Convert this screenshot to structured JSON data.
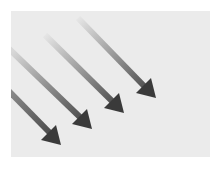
{
  "image": {
    "description": "Four parallel diagonal arrows pointing down-right, fading from light at the tail to dark gray at the head",
    "background_color": "#ebebeb",
    "page_color": "#ffffff",
    "arrow_color_head": "#3a3a3a",
    "arrow_color_tail": "#e0e0e0",
    "arrows": [
      {
        "x1": 78,
        "y1": 18,
        "x2": 156,
        "y2": 98
      },
      {
        "x1": 45,
        "y1": 35,
        "x2": 124,
        "y2": 113
      },
      {
        "x1": 12,
        "y1": 52,
        "x2": 92,
        "y2": 129
      },
      {
        "x1": 11,
        "y1": 92,
        "x2": 61,
        "y2": 145
      }
    ]
  }
}
